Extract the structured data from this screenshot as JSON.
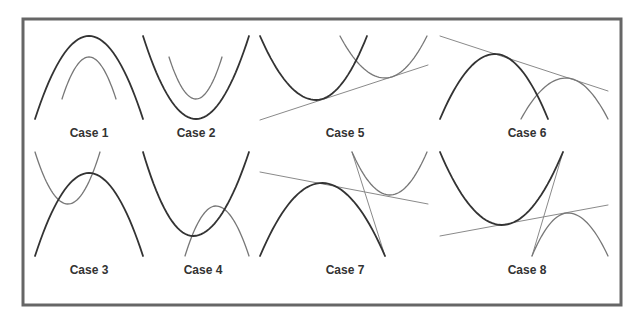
{
  "figure": {
    "colors": {
      "frame": "#666666",
      "primary_curve": "#333333",
      "secondary_curve": "#777777",
      "tangent_line": "#8a8a8a",
      "label": "#333333",
      "background": "#ffffff"
    },
    "cases": [
      {
        "id": "case-1",
        "label": "Case 1",
        "label_pos": [
          89,
          137
        ],
        "description": "Two downward parabolas, nested, no intersection",
        "primary": {
          "type": "parabola",
          "from": [
            35,
            119
          ],
          "vertex": [
            89,
            36
          ],
          "to": [
            143,
            119
          ]
        },
        "secondary": {
          "type": "parabola",
          "from": [
            62,
            99
          ],
          "vertex": [
            89,
            57
          ],
          "to": [
            116,
            99
          ]
        },
        "lines": []
      },
      {
        "id": "case-2",
        "label": "Case 2",
        "label_pos": [
          196,
          137
        ],
        "description": "Two upward parabolas, nested, no intersection",
        "primary": {
          "type": "parabola",
          "from": [
            143,
            36
          ],
          "vertex": [
            196,
            119
          ],
          "to": [
            249,
            36
          ]
        },
        "secondary": {
          "type": "parabola",
          "from": [
            169,
            57
          ],
          "vertex": [
            196,
            99
          ],
          "to": [
            222,
            57
          ]
        },
        "lines": []
      },
      {
        "id": "case-3",
        "label": "Case 3",
        "label_pos": [
          89,
          274
        ],
        "description": "Downward parabola intersecting an upward parabola",
        "primary": {
          "type": "parabola",
          "from": [
            35,
            256
          ],
          "vertex": [
            89,
            173
          ],
          "to": [
            143,
            256
          ]
        },
        "secondary": {
          "type": "parabola",
          "from": [
            35,
            152
          ],
          "vertex": [
            68,
            204
          ],
          "to": [
            100,
            152
          ]
        },
        "lines": []
      },
      {
        "id": "case-4",
        "label": "Case 4",
        "label_pos": [
          203,
          274
        ],
        "description": "Upward parabola intersecting a downward parabola",
        "primary": {
          "type": "parabola",
          "from": [
            143,
            152
          ],
          "vertex": [
            193,
            236
          ],
          "to": [
            249,
            152
          ]
        },
        "secondary": {
          "type": "parabola",
          "from": [
            185,
            256
          ],
          "vertex": [
            216,
            206
          ],
          "to": [
            249,
            256
          ]
        },
        "lines": []
      },
      {
        "id": "case-5",
        "label": "Case 5",
        "label_pos": [
          345,
          137
        ],
        "description": "Two upward parabolas with a common tangent line below",
        "primary": {
          "type": "parabola",
          "from": [
            260,
            36
          ],
          "vertex": [
            316,
            100
          ],
          "to": [
            367,
            36
          ]
        },
        "secondary": {
          "type": "parabola",
          "from": [
            340,
            36
          ],
          "vertex": [
            385,
            78
          ],
          "to": [
            427,
            36
          ]
        },
        "lines": [
          {
            "from": [
              260,
              120
            ],
            "to": [
              428,
              65
            ]
          }
        ]
      },
      {
        "id": "case-6",
        "label": "Case 6",
        "label_pos": [
          527,
          137
        ],
        "description": "Two downward parabolas with a common tangent line above",
        "primary": {
          "type": "parabola",
          "from": [
            440,
            119
          ],
          "vertex": [
            495,
            54
          ],
          "to": [
            548,
            119
          ]
        },
        "secondary": {
          "type": "parabola",
          "from": [
            521,
            119
          ],
          "vertex": [
            566,
            78
          ],
          "to": [
            608,
            119
          ]
        },
        "lines": [
          {
            "from": [
              440,
              36
            ],
            "to": [
              608,
              91
            ]
          }
        ]
      },
      {
        "id": "case-7",
        "label": "Case 7",
        "label_pos": [
          345,
          274
        ],
        "description": "Downward and upward parabola with two common tangent lines",
        "primary": {
          "type": "parabola",
          "from": [
            260,
            256
          ],
          "vertex": [
            322,
            183
          ],
          "to": [
            385,
            256
          ]
        },
        "secondary": {
          "type": "parabola",
          "from": [
            352,
            152
          ],
          "vertex": [
            390,
            195
          ],
          "to": [
            427,
            152
          ]
        },
        "lines": [
          {
            "from": [
              260,
              172
            ],
            "to": [
              428,
              204
            ]
          },
          {
            "from": [
              352,
              152
            ],
            "to": [
              385,
              256
            ]
          }
        ]
      },
      {
        "id": "case-8",
        "label": "Case 8",
        "label_pos": [
          527,
          274
        ],
        "description": "Upward and downward parabola with two common tangent lines",
        "primary": {
          "type": "parabola",
          "from": [
            440,
            152
          ],
          "vertex": [
            502,
            225
          ],
          "to": [
            563,
            152
          ]
        },
        "secondary": {
          "type": "parabola",
          "from": [
            532,
            256
          ],
          "vertex": [
            568,
            213
          ],
          "to": [
            608,
            256
          ]
        },
        "lines": [
          {
            "from": [
              440,
              236
            ],
            "to": [
              608,
              205
            ]
          },
          {
            "from": [
              532,
              256
            ],
            "to": [
              563,
              152
            ]
          }
        ]
      }
    ],
    "frame_rect": {
      "x": 23,
      "y": 19,
      "width": 598,
      "height": 286
    }
  }
}
